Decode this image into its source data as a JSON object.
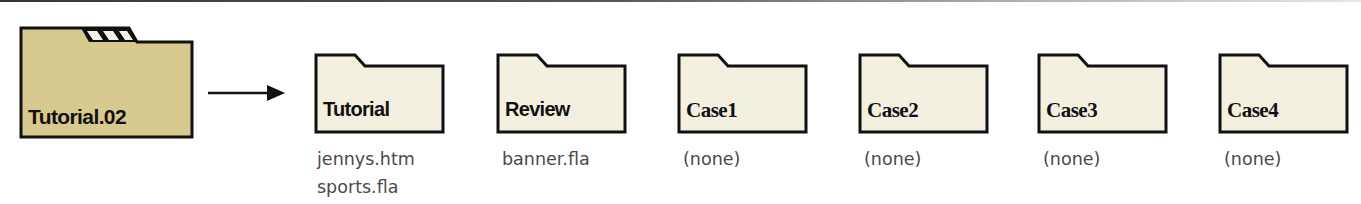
{
  "diagram": {
    "type": "folder-structure",
    "root": {
      "label": "Tutorial.02",
      "color": "#d8c98f",
      "icon": "folder-icon"
    },
    "arrow": "arrow-right-icon",
    "subfolders": [
      {
        "label": "Tutorial",
        "files": [
          "jennys.htm",
          "sports.fla"
        ]
      },
      {
        "label": "Review",
        "files": [
          "banner.fla"
        ]
      },
      {
        "label": "Case1",
        "files": [
          "(none)"
        ]
      },
      {
        "label": "Case2",
        "files": [
          "(none)"
        ]
      },
      {
        "label": "Case3",
        "files": [
          "(none)"
        ]
      },
      {
        "label": "Case4",
        "files": [
          "(none)"
        ]
      }
    ],
    "subfolder_color": "#f3f0e0",
    "outline_color": "#111111"
  }
}
